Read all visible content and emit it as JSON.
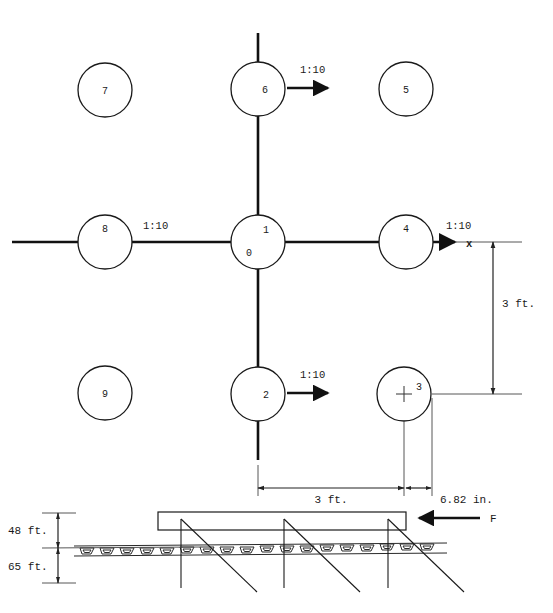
{
  "diagram": {
    "stroke_color": "#1a1a1a",
    "background_color": "#ffffff",
    "axis_label_x": "x",
    "piles": [
      {
        "label": "7",
        "cx": 105,
        "cy": 90,
        "r": 27
      },
      {
        "label": "6",
        "cx": 258,
        "cy": 89,
        "r": 27
      },
      {
        "label": "5",
        "cx": 406,
        "cy": 89,
        "r": 27
      },
      {
        "label": "8",
        "cx": 105,
        "cy": 242,
        "r": 27
      },
      {
        "label": "1",
        "cx": 258,
        "cy": 242,
        "r": 27
      },
      {
        "label": "4",
        "cx": 406,
        "cy": 242,
        "r": 27
      },
      {
        "label": "9",
        "cx": 105,
        "cy": 393,
        "r": 27
      },
      {
        "label": "2",
        "cx": 258,
        "cy": 394,
        "r": 27
      },
      {
        "label": "3",
        "cx": 404,
        "cy": 394,
        "r": 27
      }
    ],
    "origin_label": "0",
    "center_label": "1",
    "batter_labels": [
      {
        "text": "1:10",
        "x": 300,
        "y": 73
      },
      {
        "text": "1:10",
        "x": 145,
        "y": 228
      },
      {
        "text": "1:10",
        "x": 300,
        "y": 378
      },
      {
        "text": "1:10",
        "x": 448,
        "y": 228
      }
    ],
    "dimensions": {
      "vertical_right": "3 ft.",
      "horizontal_main": "3 ft.",
      "horizontal_offset": "6.82 in.",
      "elevation_upper": "48 ft.",
      "elevation_lower": "65 ft."
    },
    "force_label": "F"
  }
}
